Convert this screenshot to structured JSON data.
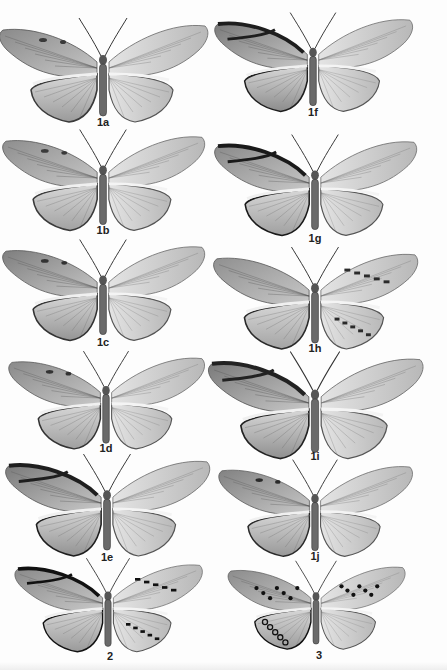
{
  "plate": {
    "background": "#fdfdfd",
    "specimens": [
      {
        "id": "1a",
        "label": "1a",
        "cx": 103,
        "cy": 70,
        "scale": 1.0,
        "fore": "#8a8a8a",
        "hind": "#9a9a9a",
        "dark": "#3a3a3a",
        "pattern": "plain-left"
      },
      {
        "id": "1f",
        "label": "1f",
        "cx": 313,
        "cy": 62,
        "scale": 0.95,
        "fore": "#7a7a7a",
        "hind": "#8c8c8c",
        "dark": "#1e1e1e",
        "pattern": "banded-left"
      },
      {
        "id": "1b",
        "label": "1b",
        "cx": 103,
        "cy": 180,
        "scale": 0.97,
        "fore": "#8e8e8e",
        "hind": "#a2a2a2",
        "dark": "#3a3a3a",
        "pattern": "plain-left"
      },
      {
        "id": "1g",
        "label": "1g",
        "cx": 315,
        "cy": 185,
        "scale": 0.97,
        "fore": "#8a8a8a",
        "hind": "#a0a0a0",
        "dark": "#1a1a1a",
        "pattern": "dark-margin"
      },
      {
        "id": "1c",
        "label": "1c",
        "cx": 103,
        "cy": 290,
        "scale": 0.97,
        "fore": "#7e7e7e",
        "hind": "#959595",
        "dark": "#333333",
        "pattern": "plain-left"
      },
      {
        "id": "1h",
        "label": "1h",
        "cx": 315,
        "cy": 298,
        "scale": 0.98,
        "fore": "#909090",
        "hind": "#a4a4a4",
        "dark": "#2a2a2a",
        "pattern": "spotted-right"
      },
      {
        "id": "1d",
        "label": "1d",
        "cx": 106,
        "cy": 400,
        "scale": 0.94,
        "fore": "#8a8a8a",
        "hind": "#a0a0a0",
        "dark": "#333333",
        "pattern": "plain-left"
      },
      {
        "id": "1i",
        "label": "1i",
        "cx": 315,
        "cy": 405,
        "scale": 1.03,
        "fore": "#7a7a7a",
        "hind": "#909090",
        "dark": "#222222",
        "pattern": "dark-margin"
      },
      {
        "id": "1e",
        "label": "1e",
        "cx": 107,
        "cy": 505,
        "scale": 0.98,
        "fore": "#7a7a7a",
        "hind": "#929292",
        "dark": "#1e1e1e",
        "pattern": "dark-margin"
      },
      {
        "id": "1j",
        "label": "1j",
        "cx": 315,
        "cy": 508,
        "scale": 0.93,
        "fore": "#828282",
        "hind": "#989898",
        "dark": "#2a2a2a",
        "pattern": "plain-left"
      },
      {
        "id": "2",
        "label": "2",
        "cx": 108,
        "cy": 605,
        "scale": 0.9,
        "fore": "#8a8a8a",
        "hind": "#9a9a9a",
        "dark": "#111111",
        "pattern": "tiger"
      },
      {
        "id": "3",
        "label": "3",
        "cx": 316,
        "cy": 605,
        "scale": 0.85,
        "fore": "#8c8c8c",
        "hind": "#9c9c9c",
        "dark": "#111111",
        "pattern": "spotted"
      }
    ],
    "labels": [
      {
        "text": "1a",
        "x": 103,
        "y": 116
      },
      {
        "text": "1f",
        "x": 313,
        "y": 106
      },
      {
        "text": "1b",
        "x": 103,
        "y": 224
      },
      {
        "text": "1g",
        "x": 315,
        "y": 232
      },
      {
        "text": "1c",
        "x": 103,
        "y": 336
      },
      {
        "text": "1h",
        "x": 315,
        "y": 342
      },
      {
        "text": "1d",
        "x": 106,
        "y": 442
      },
      {
        "text": "1i",
        "x": 315,
        "y": 450
      },
      {
        "text": "1e",
        "x": 107,
        "y": 551
      },
      {
        "text": "1j",
        "x": 315,
        "y": 550
      },
      {
        "text": "2",
        "x": 110,
        "y": 650
      },
      {
        "text": "3",
        "x": 319,
        "y": 649
      }
    ]
  }
}
